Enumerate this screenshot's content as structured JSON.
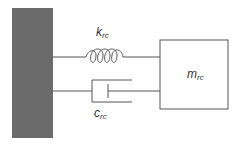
{
  "diagram": {
    "type": "spring-mass-damper",
    "wall": {
      "label": "",
      "color": "#6b6b6b"
    },
    "spring": {
      "symbol": "k",
      "subscript": "rc"
    },
    "damper": {
      "symbol": "c",
      "subscript": "rc"
    },
    "mass": {
      "symbol": "m",
      "subscript": "rc"
    },
    "line_color": "#555555"
  }
}
